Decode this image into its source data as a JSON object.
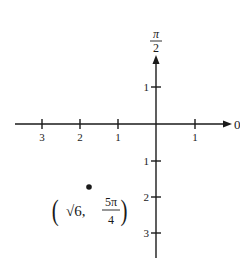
{
  "diagram": {
    "type": "polar-coordinate-plot",
    "axes": {
      "polar_axis_label": "0",
      "vertical_axis_label": "π/2",
      "vertical_axis_label_num": "π",
      "vertical_axis_label_den": "2"
    },
    "horizontal_ticks": [
      {
        "label": "3",
        "x": 42
      },
      {
        "label": "2",
        "x": 80
      },
      {
        "label": "1",
        "x": 118
      },
      {
        "label": "1",
        "x": 195
      }
    ],
    "vertical_ticks": [
      {
        "label": "1",
        "y": 87
      },
      {
        "label": "1",
        "y": 161
      },
      {
        "label": "2",
        "y": 197
      },
      {
        "label": "3",
        "y": 233
      }
    ],
    "point": {
      "r": "√6",
      "theta": "5π/4",
      "label_r": "√6,",
      "label_theta_num": "5π",
      "label_theta_den": "4",
      "open_paren": "(",
      "close_paren": ")"
    },
    "colors": {
      "ink": "#1a1a1a",
      "background": "#ffffff"
    }
  }
}
